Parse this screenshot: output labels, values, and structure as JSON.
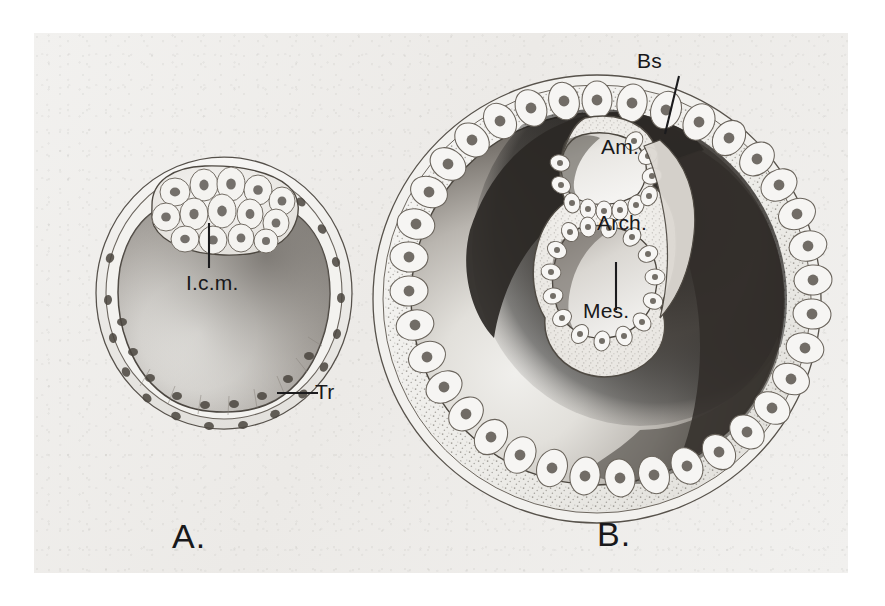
{
  "plate": {
    "background_color": "#efeeec",
    "page_color": "#ffffff",
    "ink_color": "#1b1b1d",
    "description": "Two-panel pencil-and-wash histological drawing of mammalian embryo sections"
  },
  "panels": [
    {
      "id": "A",
      "caption": "A.",
      "subject": "blastocyst with inner cell mass and trophoblast",
      "labels": [
        {
          "key": "icm",
          "text": "I.c.m.",
          "meaning": "inner cell mass",
          "leader": "vertical"
        },
        {
          "key": "tr",
          "text": "Tr",
          "meaning": "trophoblast",
          "leader": "horizontal"
        }
      ]
    },
    {
      "id": "B",
      "caption": "B.",
      "subject": "gastrulating embryo with amnion, archenteron and mesoderm",
      "labels": [
        {
          "key": "bs",
          "text": "Bs",
          "meaning": "blastocyst space",
          "leader": "oblique"
        },
        {
          "key": "am",
          "text": "Am.",
          "meaning": "amnion",
          "leader": "none"
        },
        {
          "key": "arch",
          "text": "Arch.",
          "meaning": "archenteron",
          "leader": "none"
        },
        {
          "key": "mes",
          "text": "Mes.",
          "meaning": "mesoderm",
          "leader": "vertical"
        }
      ]
    }
  ]
}
